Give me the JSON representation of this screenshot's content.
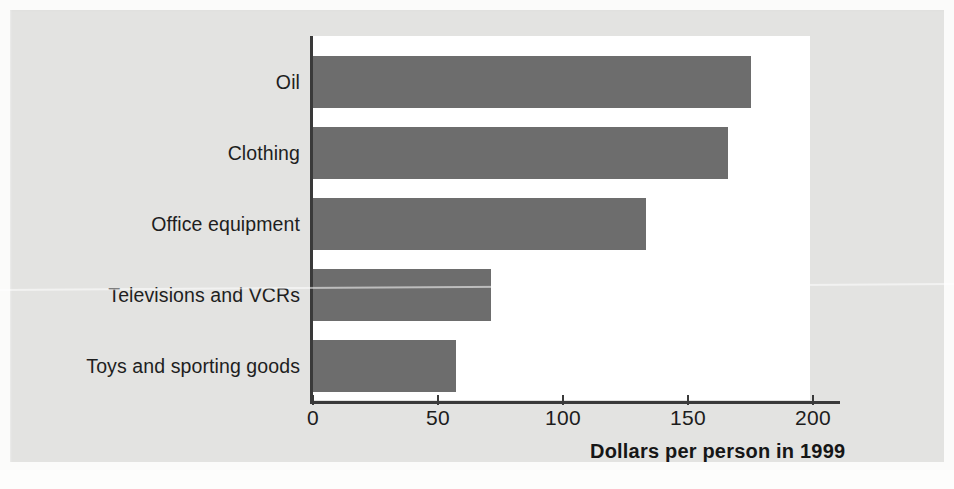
{
  "chart_data": {
    "type": "bar",
    "orientation": "horizontal",
    "title": "",
    "subtitle": "",
    "xlabel": "Dollars per person in 1999",
    "ylabel": "",
    "categories": [
      "Oil",
      "Clothing",
      "Office equipment",
      "Televisions and VCRs",
      "Toys and sporting goods"
    ],
    "values": [
      175,
      166,
      133,
      71,
      57
    ],
    "xlim": [
      0,
      210
    ],
    "x_ticks": [
      0,
      50,
      100,
      150,
      200
    ],
    "x_tick_labels": [
      "0",
      "50",
      "100",
      "150",
      "200"
    ],
    "grid": false,
    "legend": "none",
    "bar_color": "#6d6d6d",
    "plot_background": "#ffffff",
    "figure_background": "#e3e3e1",
    "axis_color": "#3a3a3a",
    "text_color": "#1c1c1c"
  }
}
